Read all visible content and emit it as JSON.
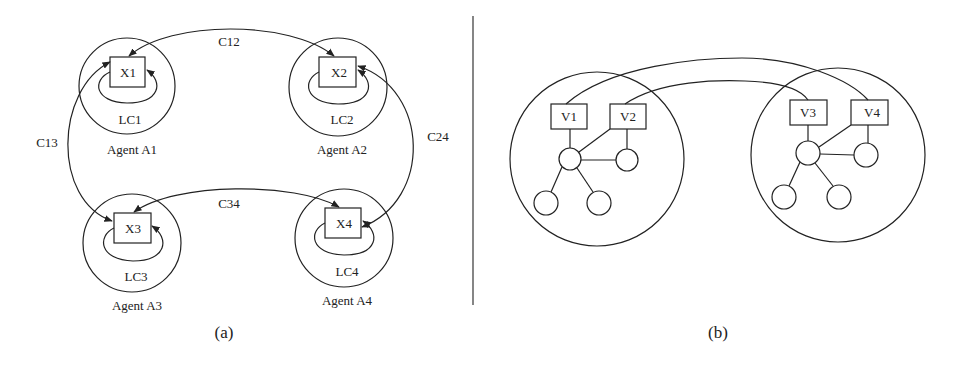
{
  "panel_a": {
    "caption": "(a)",
    "agents": [
      {
        "name": "Agent A1",
        "variable": "X1",
        "local_constraint": "LC1"
      },
      {
        "name": "Agent A2",
        "variable": "X2",
        "local_constraint": "LC2"
      },
      {
        "name": "Agent A3",
        "variable": "X3",
        "local_constraint": "LC3"
      },
      {
        "name": "Agent A4",
        "variable": "X4",
        "local_constraint": "LC4"
      }
    ],
    "constraints": [
      {
        "label": "C12",
        "from": "X1",
        "to": "X2"
      },
      {
        "label": "C13",
        "from": "X1",
        "to": "X3"
      },
      {
        "label": "C24",
        "from": "X2",
        "to": "X4"
      },
      {
        "label": "C34",
        "from": "X3",
        "to": "X4"
      }
    ]
  },
  "panel_b": {
    "caption": "(b)",
    "clusters": [
      {
        "variables": [
          "V1",
          "V2"
        ]
      },
      {
        "variables": [
          "V3",
          "V4"
        ]
      }
    ],
    "links": [
      {
        "from": "V1",
        "to": "V4"
      },
      {
        "from": "V2",
        "to": "V3"
      }
    ]
  }
}
